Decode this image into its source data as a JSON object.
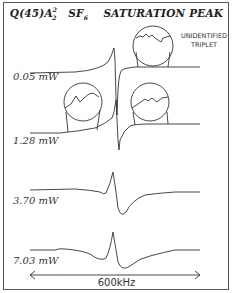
{
  "figure": {
    "title": "Q(45)A",
    "title_sup": "2",
    "title_sub": "2",
    "title_molecule": "SF",
    "title_molecule_sub": "6",
    "title_suffix": "SATURATION PEAK",
    "annotation": "UNIDENTIFIED\nTRIPLET",
    "annotation_line1": "UNIDENTIFIED",
    "annotation_line2": "TRIPLET",
    "traces": [
      {
        "label": "0.05  mW",
        "power_mW": 0.05
      },
      {
        "label": "1.28  mW",
        "power_mW": 1.28
      },
      {
        "label": "3.70  mW",
        "power_mW": 3.7
      },
      {
        "label": "7.03  mW",
        "power_mW": 7.03
      }
    ],
    "scale_bar": {
      "label": "600kHz",
      "span_kHz": 600
    }
  }
}
